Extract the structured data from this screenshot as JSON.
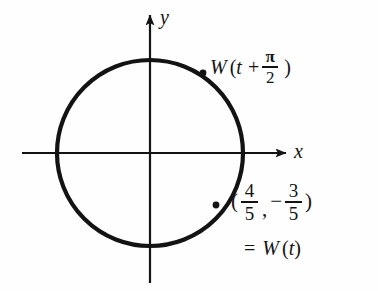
{
  "figure": {
    "background_color": "#fefefe",
    "ink_color": "#131313"
  },
  "axes": {
    "x_label": "x",
    "y_label": "y",
    "origin": {
      "x": 150,
      "y": 153
    },
    "x_axis": {
      "start_x": 22,
      "end_x": 288,
      "y": 153,
      "arrow": "right"
    },
    "y_axis": {
      "x": 150,
      "start_y": 283,
      "end_y": 12,
      "arrow": "up"
    }
  },
  "circle": {
    "center_x": 150,
    "center_y": 153,
    "radius": 93,
    "stroke_width": 4.2,
    "stroke_color": "#131313",
    "fill": "none"
  },
  "points": [
    {
      "name": "W(t + pi/2)",
      "x": 203,
      "y": 73,
      "radius": 3.4
    },
    {
      "name": "W(t)",
      "x": 216,
      "y": 205,
      "radius": 3.4
    }
  ],
  "labels": {
    "w_shift": {
      "function_name": "W",
      "open_paren": "(",
      "variable": "t",
      "operator": "+",
      "fraction": {
        "numerator": "π",
        "denominator": "2"
      },
      "close_paren": ")"
    },
    "coords": {
      "open_paren": "(",
      "x_fraction": {
        "numerator": "4",
        "denominator": "5"
      },
      "comma": ",",
      "minus": "−",
      "y_fraction": {
        "numerator": "3",
        "denominator": "5"
      },
      "close_paren": ")"
    },
    "equals_wt": {
      "equals": "=",
      "function_name": "W",
      "open_paren": "(",
      "variable": "t",
      "close_paren": ")"
    }
  }
}
